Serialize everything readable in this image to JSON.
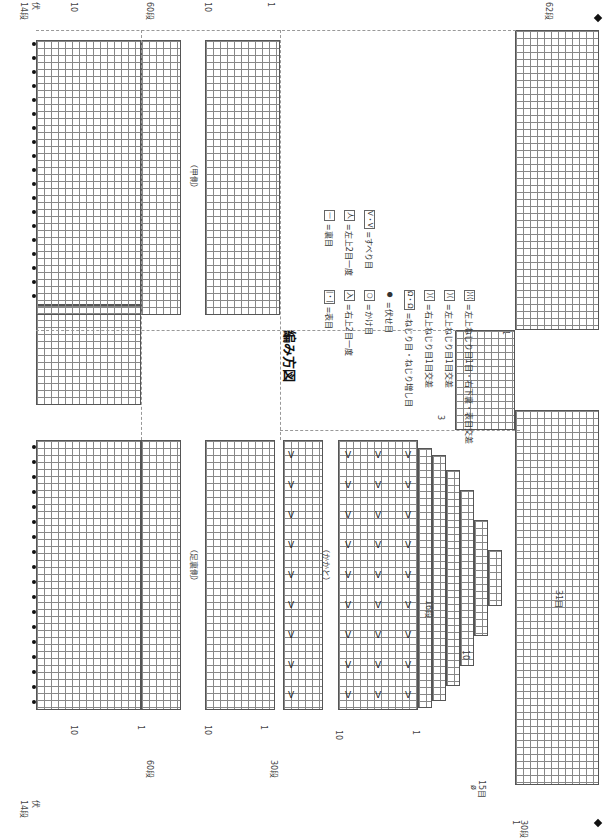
{
  "title": "編み方図",
  "sections": {
    "sole": {
      "label": "（足裏側）"
    },
    "instep": {
      "label": "（甲側）"
    },
    "heel": {
      "label": "（かかと）"
    }
  },
  "row_markers": {
    "bind_off": "伏",
    "row14": "14段",
    "row10": "10",
    "row1": "1",
    "row60": "60段",
    "row30": "30段",
    "row16": "16段",
    "row3": "3",
    "row62": "62段"
  },
  "stitch_counts": {
    "st15": "15目",
    "st31": "31目",
    "zero_mark": "ø"
  },
  "legend": {
    "items": [
      {
        "symbol": "|・|",
        "label": "=表目"
      },
      {
        "symbol": "—",
        "label": "=裏目"
      },
      {
        "symbol": "入",
        "label": "=右上2目一度"
      },
      {
        "symbol": "人",
        "label": "=左上2目一度"
      },
      {
        "symbol": "○",
        "label": "=かけ目"
      },
      {
        "symbol": "V・V",
        "label": "=すべり目"
      },
      {
        "symbol": "●",
        "label": "=伏せ目"
      },
      {
        "symbol": "Ω・Ω",
        "label": "=ねじり目・ねじり増し目"
      },
      {
        "symbol": "⟩⟨",
        "label": "=右上ねじり目1目交差"
      },
      {
        "symbol": "⟩⟨",
        "label": "=左上ねじり目1目交差"
      },
      {
        "symbol": "⟩⟨⟨",
        "label": "=左上ねじり目1目・右下裏・表目交差"
      }
    ]
  },
  "colors": {
    "grid": "#888888",
    "border": "#555555",
    "dash": "#999999",
    "ink": "#222222"
  }
}
